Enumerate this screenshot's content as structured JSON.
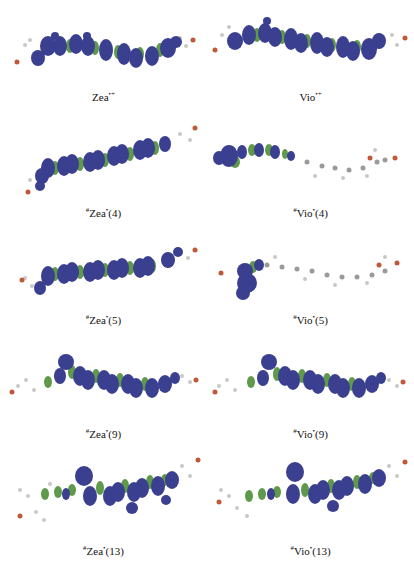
{
  "figure": {
    "panels": [
      {
        "id": "zea-cation",
        "caption_sup_pre": "",
        "caption_main": "Zea",
        "caption_sup_post": "•+",
        "caption_tail": "",
        "column": 0,
        "row": 0
      },
      {
        "id": "vio-cation",
        "caption_sup_pre": "",
        "caption_main": "Vio",
        "caption_sup_post": "•+",
        "caption_tail": "",
        "column": 1,
        "row": 0
      },
      {
        "id": "zea-4",
        "caption_sup_pre": "#",
        "caption_main": "Zea",
        "caption_sup_post": "•",
        "caption_tail": "(4)",
        "column": 0,
        "row": 1
      },
      {
        "id": "vio-4",
        "caption_sup_pre": "#",
        "caption_main": "Vio",
        "caption_sup_post": "•",
        "caption_tail": "(4)",
        "column": 1,
        "row": 1
      },
      {
        "id": "zea-5",
        "caption_sup_pre": "#",
        "caption_main": "Zea",
        "caption_sup_post": "•",
        "caption_tail": "(5)",
        "column": 0,
        "row": 2
      },
      {
        "id": "vio-5",
        "caption_sup_pre": "#",
        "caption_main": "Vio",
        "caption_sup_post": "•",
        "caption_tail": "(5)",
        "column": 1,
        "row": 2
      },
      {
        "id": "zea-9",
        "caption_sup_pre": "#",
        "caption_main": "Zea",
        "caption_sup_post": "•",
        "caption_tail": "(9)",
        "column": 0,
        "row": 3
      },
      {
        "id": "vio-9",
        "caption_sup_pre": "#",
        "caption_main": "Vio",
        "caption_sup_post": "•",
        "caption_tail": "(9)",
        "column": 1,
        "row": 3
      },
      {
        "id": "zea-13",
        "caption_sup_pre": "#",
        "caption_main": "Zea",
        "caption_sup_post": "•",
        "caption_tail": "(13)",
        "column": 0,
        "row": 4
      },
      {
        "id": "vio-13",
        "caption_sup_pre": "#",
        "caption_main": "Vio",
        "caption_sup_post": "•",
        "caption_tail": "(13)",
        "column": 1,
        "row": 4
      }
    ],
    "colors": {
      "lobe_positive": "#3b3f8f",
      "lobe_negative": "#5e9a4a",
      "hydrogen": "#c8c8c8",
      "carbon": "#6a6a6a",
      "oxygen": "#c0583a"
    }
  }
}
